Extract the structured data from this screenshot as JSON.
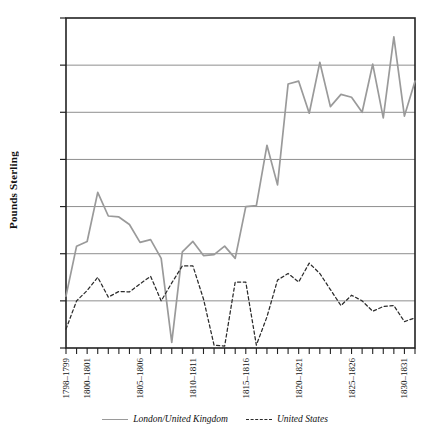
{
  "chart_data": {
    "type": "line",
    "title": "",
    "xlabel": "",
    "ylabel": "Pounds Sterling",
    "ylim": [
      0,
      3500000
    ],
    "ytick_labels": [
      "3,500,000",
      "3,000,000",
      "2,500,000",
      "2,000,000",
      "1,500,000",
      "1,000,000",
      "500,000",
      "0"
    ],
    "ytick_values": [
      3500000,
      3000000,
      2500000,
      2000000,
      1500000,
      1000000,
      500000,
      0
    ],
    "grid": "horizontal",
    "legend_position": "bottom-center",
    "x": [
      1798,
      1799,
      1800,
      1801,
      1802,
      1803,
      1804,
      1805,
      1806,
      1807,
      1808,
      1809,
      1810,
      1811,
      1812,
      1813,
      1814,
      1815,
      1816,
      1817,
      1818,
      1819,
      1820,
      1821,
      1822,
      1823,
      1824,
      1825,
      1826,
      1827,
      1828,
      1829,
      1830,
      1831
    ],
    "xtick_labels": [
      "1798–1799",
      "1800–1801",
      "1805–1806",
      "1810–1811",
      "1815–1816",
      "1820–1821",
      "1825–1826",
      "1830–1831"
    ],
    "xtick_positions": [
      1798,
      1800,
      1805,
      1810,
      1815,
      1820,
      1825,
      1830
    ],
    "series": [
      {
        "name": "London/United Kingdom",
        "style": "solid",
        "color": "#9a9a9a",
        "values": [
          550000,
          1080000,
          1130000,
          1650000,
          1400000,
          1390000,
          1310000,
          1120000,
          1150000,
          950000,
          60000,
          1020000,
          1130000,
          980000,
          990000,
          1080000,
          950000,
          1500000,
          1510000,
          2150000,
          1730000,
          2800000,
          2830000,
          2490000,
          3030000,
          2560000,
          2690000,
          2660000,
          2500000,
          3010000,
          2440000,
          3300000,
          2460000,
          2830000
        ]
      },
      {
        "name": "United States",
        "style": "dashed",
        "color": "#2b2b2b",
        "values": [
          200000,
          500000,
          610000,
          750000,
          540000,
          600000,
          595000,
          680000,
          760000,
          500000,
          690000,
          870000,
          870000,
          520000,
          30000,
          20000,
          700000,
          700000,
          30000,
          330000,
          720000,
          790000,
          700000,
          900000,
          790000,
          620000,
          450000,
          560000,
          500000,
          390000,
          440000,
          450000,
          280000,
          320000
        ]
      }
    ]
  },
  "legend": [
    {
      "label": "London/United Kingdom",
      "style": "solid"
    },
    {
      "label": "United States",
      "style": "dashed"
    }
  ]
}
